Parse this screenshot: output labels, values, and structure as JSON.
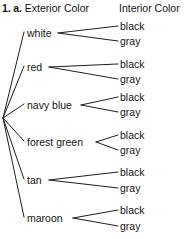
{
  "header": {
    "question_number": "1. a.",
    "left_column": "Exterior Color",
    "right_column": "Interior Color"
  },
  "diagram": {
    "type": "tree-diagram",
    "root_x": 3,
    "root_y": 118,
    "line_color": "#1f1f1f",
    "background": "#ffffff",
    "text_color": "#161616",
    "branches": [
      {
        "label": "white",
        "x": 27,
        "y": 33,
        "label_end_x": 56,
        "children": [
          {
            "label": "black",
            "y": 26
          },
          {
            "label": "gray",
            "y": 41
          }
        ]
      },
      {
        "label": "red",
        "x": 27,
        "y": 67,
        "label_end_x": 47,
        "children": [
          {
            "label": "black",
            "y": 64
          },
          {
            "label": "gray",
            "y": 79
          }
        ]
      },
      {
        "label": "navy blue",
        "x": 27,
        "y": 105,
        "label_end_x": 79,
        "children": [
          {
            "label": "black",
            "y": 97
          },
          {
            "label": "gray",
            "y": 112
          }
        ]
      },
      {
        "label": "forest green",
        "x": 27,
        "y": 142,
        "label_end_x": 94,
        "children": [
          {
            "label": "black",
            "y": 135
          },
          {
            "label": "gray",
            "y": 150
          }
        ]
      },
      {
        "label": "tan",
        "x": 27,
        "y": 180,
        "label_end_x": 47,
        "children": [
          {
            "label": "black",
            "y": 172
          },
          {
            "label": "gray",
            "y": 188
          }
        ]
      },
      {
        "label": "maroon",
        "x": 27,
        "y": 218,
        "label_end_x": 71,
        "children": [
          {
            "label": "black",
            "y": 210
          },
          {
            "label": "gray",
            "y": 226
          }
        ]
      }
    ]
  }
}
